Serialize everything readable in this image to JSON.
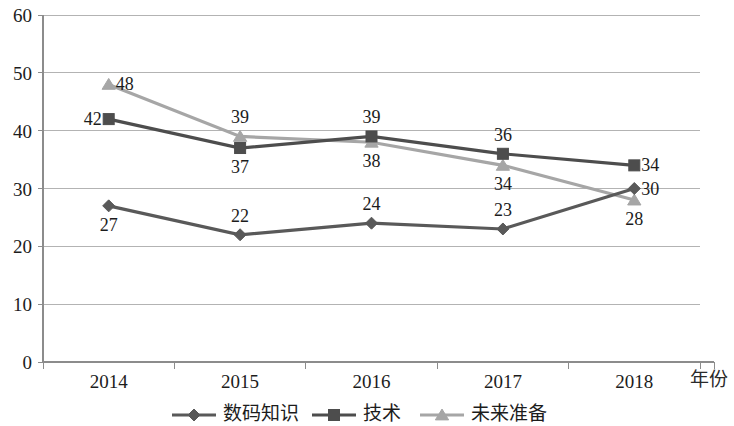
{
  "chart_data": {
    "type": "line",
    "title": "",
    "subtitle": "",
    "xlabel": "年份",
    "ylabel": "",
    "categories": [
      "2014",
      "2015",
      "2016",
      "2017",
      "2018"
    ],
    "ylim": [
      0,
      60
    ],
    "yticks": [
      0,
      10,
      20,
      30,
      40,
      50,
      60
    ],
    "ytick_labels": [
      "0",
      "10",
      "20",
      "30",
      "40",
      "50",
      "60"
    ],
    "grid": "horizontal",
    "legend_position": "bottom",
    "series": [
      {
        "name": "数码知识",
        "marker": "diamond",
        "color": "#595959",
        "values": [
          27,
          22,
          24,
          23,
          30
        ],
        "labels": [
          "27",
          "22",
          "24",
          "23",
          "30"
        ],
        "label_positions": [
          "below",
          "above",
          "above",
          "above",
          "right"
        ]
      },
      {
        "name": "技术",
        "marker": "square",
        "color": "#4d4d4d",
        "values": [
          42,
          37,
          39,
          36,
          34
        ],
        "labels": [
          "42",
          "37",
          "39",
          "36",
          "34"
        ],
        "label_positions": [
          "left",
          "below",
          "above",
          "above",
          "right"
        ]
      },
      {
        "name": "未来准备",
        "marker": "triangle",
        "color": "#a6a6a6",
        "values": [
          48,
          39,
          38,
          34,
          28
        ],
        "labels": [
          "48",
          "39",
          "38",
          "34",
          "28"
        ],
        "label_positions": [
          "right",
          "above",
          "below",
          "below",
          "below"
        ]
      }
    ],
    "colors": {
      "gridline": "#b3b3b3",
      "axis": "#8c8c8c",
      "text": "#1c1c1c",
      "background": "#ffffff"
    }
  },
  "legend": {
    "items": [
      {
        "label": "数码知识",
        "marker": "diamond",
        "color": "#595959"
      },
      {
        "label": "技术",
        "marker": "square",
        "color": "#4d4d4d"
      },
      {
        "label": "未来准备",
        "marker": "triangle",
        "color": "#a6a6a6"
      }
    ]
  },
  "axes": {
    "x_axis_title": "年份",
    "x_tick_labels": [
      "2014",
      "2015",
      "2016",
      "2017",
      "2018"
    ],
    "y_tick_labels": [
      "0",
      "10",
      "20",
      "30",
      "40",
      "50",
      "60"
    ]
  }
}
